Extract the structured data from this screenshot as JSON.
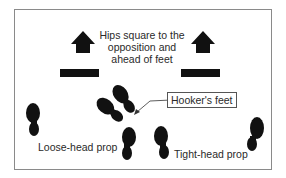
{
  "diagram": {
    "title_lines": [
      "Hips square to the",
      "opposition and",
      "ahead of feet"
    ],
    "callout_label": "Hooker's feet",
    "left_label": "Loose-head prop",
    "right_label": "Tight-head prop",
    "colors": {
      "ink": "#111111",
      "border": "#8a8a8a",
      "text": "#2a2a2a"
    },
    "elements": {
      "arrows": [
        "up-arrow-left",
        "up-arrow-right"
      ],
      "hip_bars": [
        "hip-bar-left",
        "hip-bar-right"
      ],
      "footprints": [
        "loose-head-foot-left",
        "loose-head-foot-right",
        "hooker-foot-left",
        "hooker-foot-right",
        "tight-head-foot-left",
        "tight-head-foot-right"
      ]
    }
  }
}
